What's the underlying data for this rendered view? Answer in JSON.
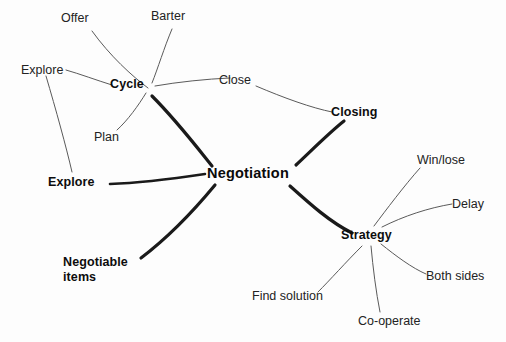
{
  "diagram": {
    "type": "mind-map",
    "title": "Negotiation",
    "background_color": "#fdfdfd",
    "line_color": "#1a1a1a",
    "thin_line_color": "#555555",
    "root": {
      "label": "Negotiation",
      "x": 253,
      "y": 173
    },
    "branches": [
      {
        "id": "cycle",
        "label": "Cycle",
        "x": 128,
        "y": 85,
        "children": [
          {
            "id": "offer",
            "label": "Offer",
            "x": 76,
            "y": 18
          },
          {
            "id": "barter",
            "label": "Barter",
            "x": 170,
            "y": 16
          },
          {
            "id": "close",
            "label": "Close",
            "x": 236,
            "y": 80
          },
          {
            "id": "plan",
            "label": "Plan",
            "x": 107,
            "y": 137
          },
          {
            "id": "explore-leaf",
            "label": "Explore",
            "x": 42,
            "y": 70
          }
        ]
      },
      {
        "id": "closing",
        "label": "Closing",
        "x": 352,
        "y": 112,
        "children": []
      },
      {
        "id": "explore",
        "label": "Explore",
        "x": 76,
        "y": 182,
        "children": []
      },
      {
        "id": "negotiable-items",
        "label": "Negotiable",
        "label_line2": "items",
        "x": 92,
        "y": 264,
        "children": []
      },
      {
        "id": "strategy",
        "label": "Strategy",
        "x": 370,
        "y": 235,
        "children": [
          {
            "id": "win-lose",
            "label": "Win/lose",
            "x": 440,
            "y": 160
          },
          {
            "id": "delay",
            "label": "Delay",
            "x": 469,
            "y": 204
          },
          {
            "id": "both-sides",
            "label": "Both sides",
            "x": 456,
            "y": 276
          },
          {
            "id": "co-operate",
            "label": "Co-operate",
            "x": 390,
            "y": 321
          },
          {
            "id": "find-solution",
            "label": "Find solution",
            "x": 287,
            "y": 296
          }
        ]
      }
    ]
  }
}
